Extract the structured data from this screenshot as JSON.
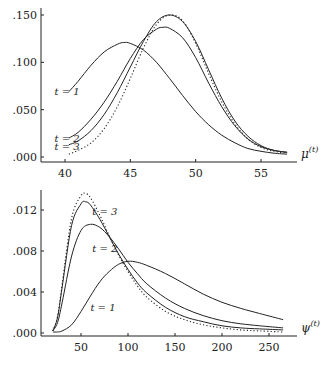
{
  "chart_data": [
    {
      "type": "line",
      "title": "",
      "xlabel": "μ(t)",
      "xlabel_base": "μ",
      "xlabel_sup": "(t)",
      "ylabel": "",
      "xlim": [
        38.3,
        58
      ],
      "ylim": [
        -0.004,
        0.156
      ],
      "xticks": [
        40,
        45,
        50,
        55
      ],
      "xtick_labels": [
        "40",
        "45",
        "50",
        "55"
      ],
      "yticks": [
        0.0,
        0.05,
        0.1,
        0.15
      ],
      "ytick_labels": [
        ".000",
        ".050",
        ".100",
        ".150"
      ],
      "grid": false,
      "legend": "inline labels",
      "annotations": [
        {
          "text": "t = 1",
          "x": 39.2,
          "y": 0.069
        },
        {
          "text": "t = 2",
          "x": 39.2,
          "y": 0.019
        },
        {
          "text": "t = 3",
          "x": 39.2,
          "y": 0.011
        }
      ],
      "series": [
        {
          "name": "t = 1",
          "style": "solid",
          "x": [
            40.3,
            41,
            42,
            43,
            44,
            44.5,
            45,
            46,
            47,
            48,
            49,
            50,
            51,
            52,
            53,
            54,
            55,
            56,
            57
          ],
          "y": [
            0.069,
            0.08,
            0.097,
            0.111,
            0.119,
            0.121,
            0.12,
            0.113,
            0.1,
            0.083,
            0.065,
            0.048,
            0.034,
            0.023,
            0.015,
            0.009,
            0.006,
            0.004,
            0.003
          ]
        },
        {
          "name": "t = 2",
          "style": "solid",
          "x": [
            40.3,
            41,
            42,
            43,
            44,
            45,
            46,
            47,
            47.5,
            48,
            49,
            50,
            51,
            52,
            53,
            54,
            55,
            56,
            57
          ],
          "y": [
            0.02,
            0.026,
            0.04,
            0.058,
            0.08,
            0.104,
            0.124,
            0.135,
            0.137,
            0.136,
            0.126,
            0.105,
            0.078,
            0.053,
            0.033,
            0.019,
            0.011,
            0.007,
            0.005
          ]
        },
        {
          "name": "t = 3",
          "style": "solid",
          "x": [
            40.3,
            41,
            42,
            43,
            44,
            45,
            46,
            47,
            48,
            49,
            50,
            51,
            52,
            53,
            54,
            55,
            56,
            57
          ],
          "y": [
            0.013,
            0.017,
            0.028,
            0.045,
            0.068,
            0.095,
            0.122,
            0.143,
            0.15,
            0.143,
            0.122,
            0.092,
            0.062,
            0.038,
            0.022,
            0.012,
            0.007,
            0.005
          ]
        },
        {
          "name": "limit",
          "style": "dotted",
          "x": [
            40.3,
            41,
            42,
            43,
            44,
            45,
            46,
            47,
            48,
            49,
            50,
            51,
            52,
            53,
            54,
            55,
            56,
            57
          ],
          "y": [
            0.003,
            0.007,
            0.015,
            0.03,
            0.053,
            0.083,
            0.115,
            0.14,
            0.15,
            0.144,
            0.12,
            0.088,
            0.058,
            0.035,
            0.019,
            0.01,
            0.006,
            0.004
          ]
        }
      ]
    },
    {
      "type": "line",
      "title": "",
      "xlabel": "ψ(t)",
      "xlabel_base": "ψ",
      "xlabel_sup": "(t)",
      "ylabel": "",
      "xlim": [
        3,
        280
      ],
      "ylim": [
        -0.0003,
        0.0143
      ],
      "xticks": [
        50,
        100,
        150,
        200,
        250
      ],
      "xtick_labels": [
        "50",
        "100",
        "150",
        "200",
        "250"
      ],
      "yticks": [
        0.0,
        0.004,
        0.008,
        0.012
      ],
      "ytick_labels": [
        ".000",
        ".004",
        ".008",
        ".012"
      ],
      "grid": false,
      "legend": "inline labels",
      "annotations": [
        {
          "text": "t = 3",
          "x": 62,
          "y": 0.0118
        },
        {
          "text": "t = 2",
          "x": 62,
          "y": 0.0082
        },
        {
          "text": "t = 1",
          "x": 60,
          "y": 0.0024
        }
      ],
      "series": [
        {
          "name": "t = 1",
          "style": "solid",
          "x": [
            20,
            25,
            30,
            40,
            50,
            60,
            70,
            80,
            90,
            100,
            110,
            120,
            140,
            160,
            180,
            200,
            220,
            240,
            265
          ],
          "y": [
            0.0001,
            0.0001,
            0.0002,
            0.0008,
            0.0021,
            0.0036,
            0.005,
            0.006,
            0.0067,
            0.007,
            0.0069,
            0.0066,
            0.0058,
            0.0048,
            0.0038,
            0.003,
            0.0024,
            0.0019,
            0.0013
          ]
        },
        {
          "name": "t = 2",
          "style": "solid",
          "x": [
            20,
            25,
            30,
            40,
            50,
            60,
            70,
            80,
            90,
            100,
            110,
            120,
            140,
            160,
            180,
            200,
            220,
            240,
            265
          ],
          "y": [
            0.0002,
            0.001,
            0.003,
            0.0075,
            0.01,
            0.0106,
            0.0103,
            0.0094,
            0.0082,
            0.0069,
            0.0058,
            0.0048,
            0.0034,
            0.0024,
            0.0017,
            0.0012,
            0.0009,
            0.0007,
            0.0005
          ]
        },
        {
          "name": "t = 3",
          "style": "solid",
          "x": [
            20,
            25,
            30,
            40,
            50,
            55,
            60,
            70,
            80,
            90,
            100,
            110,
            120,
            140,
            160,
            180,
            200,
            220,
            240,
            265
          ],
          "y": [
            0.0002,
            0.0015,
            0.0045,
            0.0105,
            0.0126,
            0.0128,
            0.0125,
            0.0111,
            0.0094,
            0.0077,
            0.0062,
            0.0049,
            0.0039,
            0.0025,
            0.0016,
            0.0011,
            0.0007,
            0.0005,
            0.0004,
            0.0003
          ]
        },
        {
          "name": "limit",
          "style": "dotted",
          "x": [
            20,
            25,
            30,
            40,
            50,
            55,
            60,
            70,
            80,
            90,
            100,
            110,
            120,
            140,
            160,
            180,
            200,
            220,
            240,
            265
          ],
          "y": [
            0.0002,
            0.0016,
            0.0048,
            0.0112,
            0.0134,
            0.0136,
            0.0132,
            0.0115,
            0.0095,
            0.0076,
            0.006,
            0.0046,
            0.0035,
            0.0021,
            0.0013,
            0.0008,
            0.0005,
            0.0003,
            0.0002,
            0.0001
          ]
        }
      ]
    }
  ],
  "layout": [
    {
      "left": 41,
      "right": 297,
      "top": 8,
      "axis_y": 162,
      "x_px": {
        "40": 65,
        "55": 261
      },
      "y_px": {
        "0": 157,
        "0.15": 15
      }
    },
    {
      "left": 41,
      "right": 297,
      "top": 190,
      "axis_y": 336,
      "x_px": {
        "50": 81,
        "250": 269
      },
      "y_px": {
        "0": 333,
        "0.012": 210
      }
    }
  ]
}
